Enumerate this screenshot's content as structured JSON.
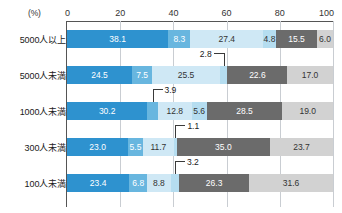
{
  "chart_data": {
    "type": "bar",
    "orientation": "horizontal",
    "stacked": true,
    "stack_mode": "percent",
    "title": "",
    "xlabel": "(%)",
    "ylabel": "",
    "xlim": [
      0,
      100
    ],
    "xticks": [
      0,
      20,
      40,
      60,
      80,
      100
    ],
    "xtick_labels": [
      "0",
      "20",
      "40",
      "60",
      "80",
      "100"
    ],
    "grid": "vertical",
    "legend": "none",
    "categories": [
      "5000人以上",
      "5000人未満",
      "1000人未満",
      "300人未満",
      "100人未満"
    ],
    "series": [
      {
        "name": "series-1",
        "color": "#2e92cf",
        "values": [
          38.1,
          24.5,
          30.2,
          23.0,
          23.4
        ]
      },
      {
        "name": "series-2",
        "color": "#68b6df",
        "values": [
          8.3,
          7.5,
          3.9,
          5.5,
          6.8
        ]
      },
      {
        "name": "series-3",
        "color": "#cfe8f5",
        "values": [
          27.4,
          25.5,
          12.8,
          11.7,
          8.8
        ]
      },
      {
        "name": "series-4",
        "color": "#b5ddf0",
        "values": [
          4.8,
          2.8,
          5.6,
          1.1,
          3.2
        ]
      },
      {
        "name": "series-5",
        "color": "#6b6b6b",
        "values": [
          15.5,
          22.6,
          28.5,
          35.0,
          26.3
        ]
      },
      {
        "name": "series-6",
        "color": "#d2d2d2",
        "values": [
          6.0,
          17.0,
          19.0,
          23.7,
          31.6
        ]
      }
    ],
    "rows": [
      {
        "label": "5000人以上",
        "segments": [
          {
            "value": 38.1,
            "display": "38.1",
            "color": "#2e92cf",
            "text_color": "#ffffff",
            "callout": false
          },
          {
            "value": 8.3,
            "display": "8.3",
            "color": "#68b6df",
            "text_color": "#ffffff",
            "callout": false
          },
          {
            "value": 27.4,
            "display": "27.4",
            "color": "#cfe8f5",
            "text_color": "#333333",
            "callout": false
          },
          {
            "value": 4.8,
            "display": "4.8",
            "color": "#b5ddf0",
            "text_color": "#333333",
            "callout": false
          },
          {
            "value": 15.5,
            "display": "15.5",
            "color": "#6b6b6b",
            "text_color": "#ffffff",
            "callout": false
          },
          {
            "value": 6.0,
            "display": "6.0",
            "color": "#d2d2d2",
            "text_color": "#333333",
            "callout": false
          }
        ]
      },
      {
        "label": "5000人未満",
        "segments": [
          {
            "value": 24.5,
            "display": "24.5",
            "color": "#2e92cf",
            "text_color": "#ffffff",
            "callout": false
          },
          {
            "value": 7.5,
            "display": "7.5",
            "color": "#68b6df",
            "text_color": "#ffffff",
            "callout": false
          },
          {
            "value": 25.5,
            "display": "25.5",
            "color": "#cfe8f5",
            "text_color": "#333333",
            "callout": false
          },
          {
            "value": 2.8,
            "display": "2.8",
            "color": "#b5ddf0",
            "text_color": "#333333",
            "callout": true
          },
          {
            "value": 22.6,
            "display": "22.6",
            "color": "#6b6b6b",
            "text_color": "#ffffff",
            "callout": false
          },
          {
            "value": 17.0,
            "display": "17.0",
            "color": "#d2d2d2",
            "text_color": "#333333",
            "callout": false
          }
        ]
      },
      {
        "label": "1000人未満",
        "segments": [
          {
            "value": 30.2,
            "display": "30.2",
            "color": "#2e92cf",
            "text_color": "#ffffff",
            "callout": false
          },
          {
            "value": 3.9,
            "display": "3.9",
            "color": "#68b6df",
            "text_color": "#ffffff",
            "callout": true
          },
          {
            "value": 12.8,
            "display": "12.8",
            "color": "#cfe8f5",
            "text_color": "#333333",
            "callout": false
          },
          {
            "value": 5.6,
            "display": "5.6",
            "color": "#b5ddf0",
            "text_color": "#333333",
            "callout": false
          },
          {
            "value": 28.5,
            "display": "28.5",
            "color": "#6b6b6b",
            "text_color": "#ffffff",
            "callout": false
          },
          {
            "value": 19.0,
            "display": "19.0",
            "color": "#d2d2d2",
            "text_color": "#333333",
            "callout": false
          }
        ]
      },
      {
        "label": "300人未満",
        "segments": [
          {
            "value": 23.0,
            "display": "23.0",
            "color": "#2e92cf",
            "text_color": "#ffffff",
            "callout": false
          },
          {
            "value": 5.5,
            "display": "5.5",
            "color": "#68b6df",
            "text_color": "#ffffff",
            "callout": false
          },
          {
            "value": 11.7,
            "display": "11.7",
            "color": "#cfe8f5",
            "text_color": "#333333",
            "callout": false
          },
          {
            "value": 1.1,
            "display": "1.1",
            "color": "#b5ddf0",
            "text_color": "#333333",
            "callout": true
          },
          {
            "value": 35.0,
            "display": "35.0",
            "color": "#6b6b6b",
            "text_color": "#ffffff",
            "callout": false
          },
          {
            "value": 23.7,
            "display": "23.7",
            "color": "#d2d2d2",
            "text_color": "#333333",
            "callout": false
          }
        ]
      },
      {
        "label": "100人未満",
        "segments": [
          {
            "value": 23.4,
            "display": "23.4",
            "color": "#2e92cf",
            "text_color": "#ffffff",
            "callout": false
          },
          {
            "value": 6.8,
            "display": "6.8",
            "color": "#68b6df",
            "text_color": "#ffffff",
            "callout": false
          },
          {
            "value": 8.8,
            "display": "8.8",
            "color": "#cfe8f5",
            "text_color": "#333333",
            "callout": false
          },
          {
            "value": 3.2,
            "display": "3.2",
            "color": "#b5ddf0",
            "text_color": "#333333",
            "callout": true
          },
          {
            "value": 26.3,
            "display": "26.3",
            "color": "#6b6b6b",
            "text_color": "#ffffff",
            "callout": false
          },
          {
            "value": 31.6,
            "display": "31.6",
            "color": "#d2d2d2",
            "text_color": "#333333",
            "callout": false
          }
        ]
      }
    ]
  },
  "axis": {
    "unit_label": "(%)",
    "ticks": [
      "0",
      "20",
      "40",
      "60",
      "80",
      "100"
    ]
  }
}
